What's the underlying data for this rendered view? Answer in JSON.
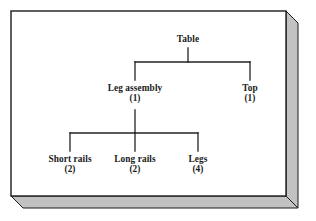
{
  "diagram": {
    "type": "bill-of-materials-tree",
    "title_node": "Table",
    "levels": [
      {
        "level": 1,
        "nodes": [
          {
            "id": "table",
            "label": "Table",
            "quantity": ""
          }
        ]
      },
      {
        "level": 2,
        "nodes": [
          {
            "id": "leg-assembly",
            "label": "Leg assembly",
            "quantity": "(1)"
          },
          {
            "id": "top",
            "label": "Top",
            "quantity": "(1)"
          }
        ]
      },
      {
        "level": 3,
        "nodes": [
          {
            "id": "short-rails",
            "label": "Short rails",
            "quantity": "(2)"
          },
          {
            "id": "long-rails",
            "label": "Long rails",
            "quantity": "(2)"
          },
          {
            "id": "legs",
            "label": "Legs",
            "quantity": "(4)"
          }
        ]
      }
    ]
  },
  "colors": {
    "line": "#222222",
    "border": "#1c1c1c",
    "bevel_face": "#c2c2c2",
    "bevel_shadow": "#9a9a9a",
    "panel": "#ffffff",
    "text": "#1a1a1a"
  }
}
